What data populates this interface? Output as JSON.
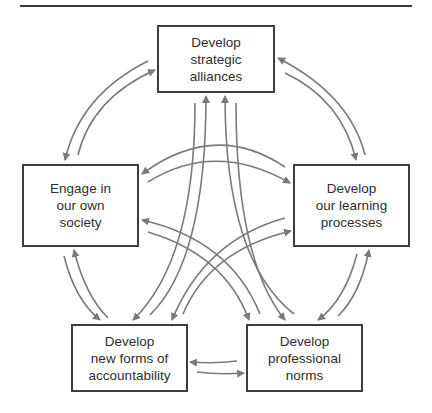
{
  "diagram": {
    "type": "cycle",
    "colors": {
      "box_border": "#3c3c3c",
      "arrow": "#7a7a7a",
      "text": "#2e2e2e"
    },
    "nodes": [
      {
        "id": "alliances",
        "label": "Develop\nstrategic\nalliances"
      },
      {
        "id": "society",
        "label": "Engage in\nour own\nsociety"
      },
      {
        "id": "learning",
        "label": "Develop\nour learning\nprocesses"
      },
      {
        "id": "accountability",
        "label": "Develop\nnew forms of\naccountability"
      },
      {
        "id": "norms",
        "label": "Develop\nprofessional\nnorms"
      }
    ],
    "edges": [
      {
        "from": "alliances",
        "to": "society",
        "bidirectional": true
      },
      {
        "from": "alliances",
        "to": "learning",
        "bidirectional": true
      },
      {
        "from": "alliances",
        "to": "accountability",
        "bidirectional": true
      },
      {
        "from": "alliances",
        "to": "norms",
        "bidirectional": true
      },
      {
        "from": "society",
        "to": "learning",
        "bidirectional": true
      },
      {
        "from": "society",
        "to": "accountability",
        "bidirectional": true
      },
      {
        "from": "society",
        "to": "norms",
        "bidirectional": true
      },
      {
        "from": "learning",
        "to": "accountability",
        "bidirectional": true
      },
      {
        "from": "learning",
        "to": "norms",
        "bidirectional": true
      },
      {
        "from": "accountability",
        "to": "norms",
        "bidirectional": true
      }
    ]
  }
}
